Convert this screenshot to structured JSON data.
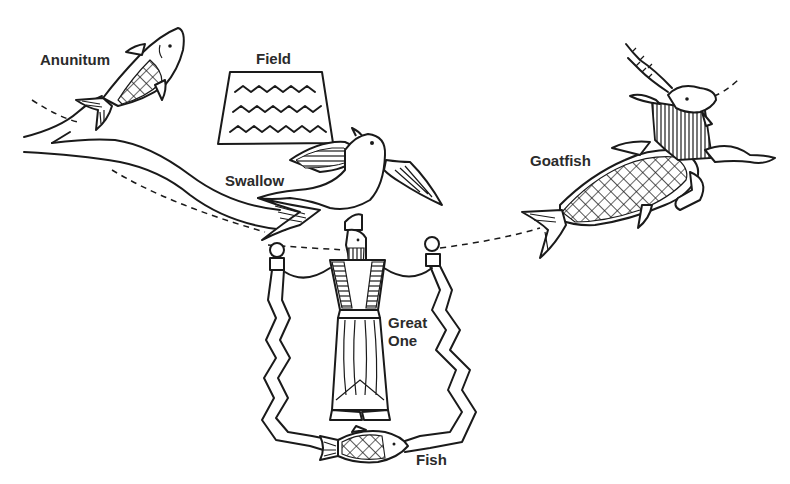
{
  "diagram": {
    "type": "illustration",
    "labels": {
      "anunitum": "Anunitum",
      "field": "Field",
      "swallow": "Swallow",
      "goatfish": "Goatfish",
      "great_one_line1": "Great",
      "great_one_line2": "One",
      "fish": "Fish"
    },
    "figures": [
      {
        "name": "Anunitum",
        "depicts": "fish with crosshatched scales"
      },
      {
        "name": "Field",
        "depicts": "trapezoid with three wavy lines"
      },
      {
        "name": "Swallow",
        "depicts": "bird with fish tail"
      },
      {
        "name": "Goatfish",
        "depicts": "goat head and forelegs with fish body"
      },
      {
        "name": "Great One",
        "depicts": "bearded standing figure holding two vases with streams"
      },
      {
        "name": "Fish",
        "depicts": "fish at junction of streams"
      }
    ],
    "colors": {
      "line": "#1a1a1a",
      "label": "#2b2b2b",
      "background": "#ffffff"
    }
  }
}
